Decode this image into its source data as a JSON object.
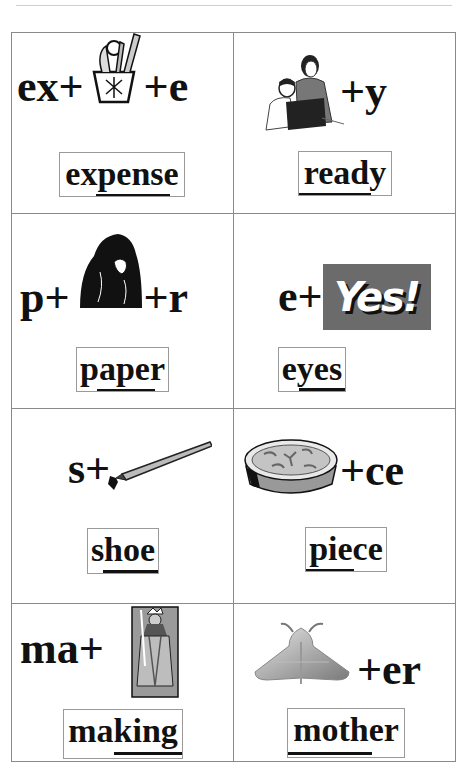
{
  "worksheet": {
    "cards": [
      {
        "id": "expense",
        "prefix": "ex+",
        "picture": "pencil-cup-icon",
        "suffix": "+e",
        "word": "expense"
      },
      {
        "id": "ready",
        "prefix": "",
        "picture": "people-reading-icon",
        "suffix": "+y",
        "word": "ready"
      },
      {
        "id": "paper",
        "prefix": "p+",
        "picture": "gorilla-icon",
        "suffix": "+r",
        "word": "paper"
      },
      {
        "id": "eyes",
        "prefix": "e+",
        "picture": "yes-sign-icon",
        "picture_text": "Yes!",
        "suffix": "",
        "word": "eyes"
      },
      {
        "id": "shoe",
        "prefix": "s+",
        "picture": "pen-nib-icon",
        "suffix": "",
        "word": "shoe"
      },
      {
        "id": "piece",
        "prefix": "",
        "picture": "pie-icon",
        "suffix": "+ce",
        "word": "piece"
      },
      {
        "id": "making",
        "prefix": "ma+",
        "picture": "king-card-icon",
        "suffix": "",
        "word": "making"
      },
      {
        "id": "mother",
        "prefix": "",
        "picture": "moth-icon",
        "suffix": "+er",
        "word": "mother"
      }
    ]
  },
  "colors": {
    "grid_line": "#8a8a8a",
    "text": "#111111",
    "yes_sign_bg": "#6b6b6b"
  }
}
